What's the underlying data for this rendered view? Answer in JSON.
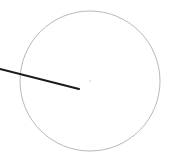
{
  "canvas": {
    "width": 170,
    "height": 168,
    "background": "#ffffff"
  },
  "dial": {
    "center": {
      "x": 90,
      "y": 81
    },
    "radius": 70,
    "stroke_color": "#b8b8b8",
    "center_dot_color": "#e0e0e0"
  },
  "pointer": {
    "x1": 0,
    "y1": 69,
    "x2": 79,
    "y2": 89,
    "color": "#1a1a1a",
    "width": 2
  }
}
